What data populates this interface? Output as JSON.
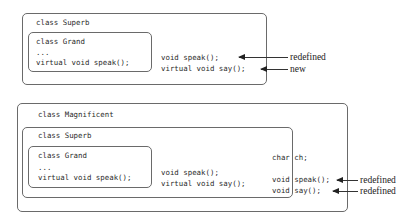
{
  "diagram1": {
    "superb": {
      "title": "class Superb",
      "grand": {
        "title": "class Grand",
        "ellipsis": "...",
        "method": "virtual void speak();"
      },
      "methods": [
        "void speak();",
        "virtual void say();"
      ]
    },
    "annotations": [
      "redefined",
      "new"
    ]
  },
  "diagram2": {
    "magnificent": {
      "title": "class Magnificent",
      "superb": {
        "title": "class Superb",
        "grand": {
          "title": "class Grand",
          "ellipsis": "...",
          "method": "virtual void speak();"
        },
        "methods": [
          "void speak();",
          "virtual void say();"
        ]
      },
      "member": "char ch;",
      "methods": [
        "void speak();",
        "void say();"
      ]
    },
    "annotations": [
      "redefined",
      "redefined"
    ]
  }
}
